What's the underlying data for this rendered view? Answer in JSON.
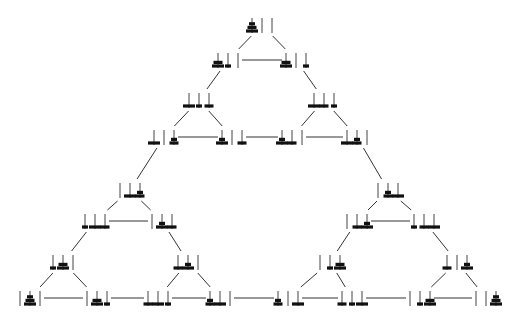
{
  "diagram": {
    "colors": {
      "disk": "#111111",
      "peg": "#444444",
      "edge": "#333333",
      "background": "#ffffff"
    },
    "disk_widths": {
      "1": 6,
      "2": 9,
      "3": 12
    },
    "nodes": [
      {
        "id": "n0",
        "x": 262,
        "y": 25,
        "pegs": [
          [
            3,
            2,
            1
          ],
          [],
          []
        ]
      },
      {
        "id": "n1",
        "x": 228,
        "y": 60,
        "pegs": [
          [
            3,
            2
          ],
          [
            1
          ],
          []
        ]
      },
      {
        "id": "n2",
        "x": 296,
        "y": 60,
        "pegs": [
          [
            3,
            2
          ],
          [],
          [
            1
          ]
        ]
      },
      {
        "id": "n3",
        "x": 199,
        "y": 100,
        "pegs": [
          [
            3
          ],
          [
            1
          ],
          [
            2
          ]
        ]
      },
      {
        "id": "n4",
        "x": 324,
        "y": 100,
        "pegs": [
          [
            3
          ],
          [
            2
          ],
          [
            1
          ]
        ]
      },
      {
        "id": "n5",
        "x": 164,
        "y": 137,
        "pegs": [
          [
            3
          ],
          [],
          [
            2,
            1
          ]
        ]
      },
      {
        "id": "n6",
        "x": 232,
        "y": 137,
        "pegs": [
          [
            3,
            1
          ],
          [],
          [
            2
          ]
        ]
      },
      {
        "id": "n7",
        "x": 292,
        "y": 137,
        "pegs": [
          [
            3,
            1
          ],
          [
            2
          ],
          []
        ]
      },
      {
        "id": "n8",
        "x": 357,
        "y": 137,
        "pegs": [
          [
            3
          ],
          [
            2,
            1
          ],
          []
        ]
      },
      {
        "id": "n9",
        "x": 130,
        "y": 190,
        "pegs": [
          [],
          [
            3
          ],
          [
            2,
            1
          ]
        ]
      },
      {
        "id": "n10",
        "x": 388,
        "y": 190,
        "pegs": [
          [],
          [
            2,
            1
          ],
          [
            3
          ]
        ]
      },
      {
        "id": "n11",
        "x": 95,
        "y": 221,
        "pegs": [
          [
            1
          ],
          [
            3
          ],
          [
            2
          ]
        ]
      },
      {
        "id": "n12",
        "x": 162,
        "y": 221,
        "pegs": [
          [],
          [
            3,
            1
          ],
          [
            2
          ]
        ]
      },
      {
        "id": "n13",
        "x": 357,
        "y": 221,
        "pegs": [
          [],
          [
            2
          ],
          [
            3,
            1
          ]
        ]
      },
      {
        "id": "n14",
        "x": 424,
        "y": 221,
        "pegs": [
          [
            1
          ],
          [
            2
          ],
          [
            3
          ]
        ]
      },
      {
        "id": "n15",
        "x": 63,
        "y": 262,
        "pegs": [
          [
            1
          ],
          [
            3,
            2
          ],
          []
        ]
      },
      {
        "id": "n16",
        "x": 188,
        "y": 262,
        "pegs": [
          [
            2
          ],
          [
            3,
            1
          ],
          []
        ]
      },
      {
        "id": "n17",
        "x": 330,
        "y": 262,
        "pegs": [
          [],
          [
            1
          ],
          [
            3,
            2
          ]
        ]
      },
      {
        "id": "n18",
        "x": 457,
        "y": 262,
        "pegs": [
          [
            2
          ],
          [],
          [
            3,
            1
          ]
        ]
      },
      {
        "id": "n19",
        "x": 30,
        "y": 298,
        "pegs": [
          [],
          [
            3,
            2,
            1
          ],
          []
        ]
      },
      {
        "id": "n20",
        "x": 97,
        "y": 298,
        "pegs": [
          [],
          [
            3,
            2
          ],
          [
            1
          ]
        ]
      },
      {
        "id": "n21",
        "x": 158,
        "y": 298,
        "pegs": [
          [
            2
          ],
          [
            3
          ],
          [
            1
          ]
        ]
      },
      {
        "id": "n22",
        "x": 220,
        "y": 298,
        "pegs": [
          [
            2,
            1
          ],
          [
            3
          ],
          []
        ]
      },
      {
        "id": "n23",
        "x": 288,
        "y": 298,
        "pegs": [
          [
            2,
            1
          ],
          [],
          [
            3
          ]
        ]
      },
      {
        "id": "n24",
        "x": 352,
        "y": 298,
        "pegs": [
          [
            2
          ],
          [
            1
          ],
          [
            3
          ]
        ]
      },
      {
        "id": "n25",
        "x": 420,
        "y": 298,
        "pegs": [
          [],
          [
            1
          ],
          [
            3,
            2
          ]
        ]
      },
      {
        "id": "n26",
        "x": 486,
        "y": 298,
        "pegs": [
          [],
          [],
          [
            3,
            2,
            1
          ]
        ]
      }
    ],
    "edges": [
      [
        "n0",
        "n1"
      ],
      [
        "n0",
        "n2"
      ],
      [
        "n1",
        "n2"
      ],
      [
        "n1",
        "n3"
      ],
      [
        "n2",
        "n4"
      ],
      [
        "n3",
        "n5"
      ],
      [
        "n3",
        "n6"
      ],
      [
        "n5",
        "n6"
      ],
      [
        "n4",
        "n7"
      ],
      [
        "n4",
        "n8"
      ],
      [
        "n7",
        "n8"
      ],
      [
        "n6",
        "n7"
      ],
      [
        "n5",
        "n9"
      ],
      [
        "n8",
        "n10"
      ],
      [
        "n9",
        "n11"
      ],
      [
        "n9",
        "n12"
      ],
      [
        "n11",
        "n12"
      ],
      [
        "n10",
        "n13"
      ],
      [
        "n10",
        "n14"
      ],
      [
        "n13",
        "n14"
      ],
      [
        "n11",
        "n15"
      ],
      [
        "n12",
        "n16"
      ],
      [
        "n13",
        "n17"
      ],
      [
        "n14",
        "n18"
      ],
      [
        "n15",
        "n19"
      ],
      [
        "n15",
        "n20"
      ],
      [
        "n19",
        "n20"
      ],
      [
        "n16",
        "n21"
      ],
      [
        "n16",
        "n22"
      ],
      [
        "n21",
        "n22"
      ],
      [
        "n17",
        "n24"
      ],
      [
        "n17",
        "n23"
      ],
      [
        "n23",
        "n24"
      ],
      [
        "n18",
        "n25"
      ],
      [
        "n18",
        "n26"
      ],
      [
        "n25",
        "n26"
      ],
      [
        "n20",
        "n21"
      ],
      [
        "n22",
        "n23"
      ],
      [
        "n24",
        "n25"
      ]
    ]
  }
}
